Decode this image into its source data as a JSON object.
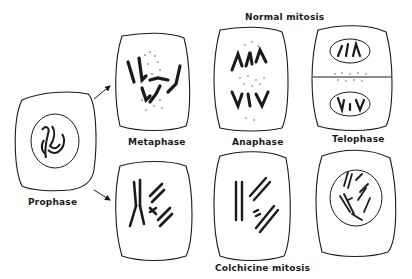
{
  "figure": {
    "sections": {
      "normal_title": "Normal mitosis",
      "colchicine_title": "Colchicine mitosis"
    },
    "stages": {
      "prophase": "Prophase",
      "metaphase": "Metaphase",
      "anaphase": "Anaphase",
      "telophase": "Telophase"
    },
    "colors": {
      "ink": "#1a1a1a",
      "stipple": "#555555",
      "background": "#ffffff"
    }
  }
}
